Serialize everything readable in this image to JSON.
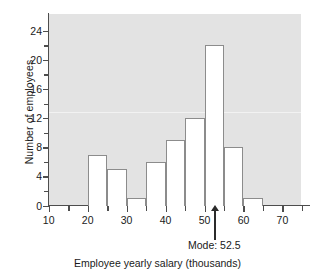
{
  "chart_data": {
    "type": "bar",
    "title": "",
    "subtitle": "",
    "xlabel": "Employee yearly salary (thousands)",
    "ylabel": "Number of employees",
    "xlim": [
      10,
      77
    ],
    "ylim": [
      0,
      25
    ],
    "grid": false,
    "legend": null,
    "bin_width": 5,
    "bins": [
      {
        "start": 20,
        "end": 25,
        "value": 7
      },
      {
        "start": 25,
        "end": 30,
        "value": 5
      },
      {
        "start": 30,
        "end": 35,
        "value": 1
      },
      {
        "start": 35,
        "end": 40,
        "value": 6
      },
      {
        "start": 40,
        "end": 45,
        "value": 9
      },
      {
        "start": 45,
        "end": 50,
        "value": 12
      },
      {
        "start": 50,
        "end": 55,
        "value": 22
      },
      {
        "start": 55,
        "end": 60,
        "value": 8
      },
      {
        "start": 60,
        "end": 65,
        "value": 1
      }
    ],
    "x_ticks_major": [
      10,
      20,
      30,
      40,
      50,
      60,
      70
    ],
    "x_ticks_minor": [
      15,
      25,
      35,
      45,
      55,
      65,
      75
    ],
    "x_tick_labels": [
      "10",
      "20",
      "30",
      "40",
      "50",
      "60",
      "70"
    ],
    "y_ticks_major": [
      0,
      4,
      8,
      12,
      16,
      20,
      24
    ],
    "y_ticks_minor": [
      2,
      6,
      10,
      14,
      18,
      22
    ],
    "y_tick_labels": [
      "0",
      "4",
      "8",
      "12",
      "16",
      "20",
      "24"
    ],
    "annotations": [
      {
        "name": "mode",
        "label": "Mode: 52.5",
        "x": 52.5,
        "value": 52.5
      }
    ],
    "colors": {
      "plot_background": "#e3e3e3",
      "bar_fill": "#ffffff",
      "bar_edge": "#8c8c8c",
      "axis": "#4d4d4d",
      "text": "#1a1a1a",
      "annotation": "#2b2b2b"
    }
  }
}
